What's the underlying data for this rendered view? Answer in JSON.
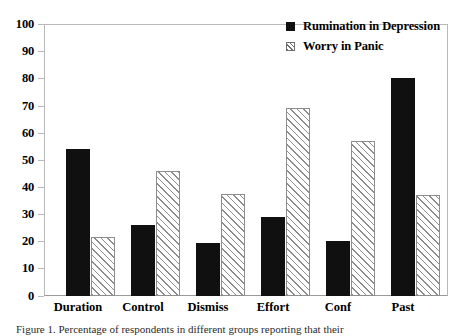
{
  "chart_data": {
    "type": "bar",
    "title": "",
    "xlabel": "",
    "ylabel": "",
    "ylim": [
      0,
      100
    ],
    "yticks": [
      0,
      10,
      20,
      30,
      40,
      50,
      60,
      70,
      80,
      90,
      100
    ],
    "grid": false,
    "legend_position": "top-right-inside",
    "categories": [
      "Duration",
      "Control",
      "Dismiss",
      "Effort",
      "Conf",
      "Past"
    ],
    "series": [
      {
        "name": "Rumination in Depression",
        "style": "solid-black",
        "values": [
          54,
          26,
          19.5,
          29,
          20,
          80
        ]
      },
      {
        "name": "Worry in Panic",
        "style": "diagonal-hatch",
        "values": [
          21.5,
          46,
          37.5,
          69,
          57,
          37
        ]
      }
    ]
  },
  "legend": {
    "items": [
      {
        "label": "Rumination in Depression",
        "swatch": "solid-square-icon"
      },
      {
        "label": "Worry in Panic",
        "swatch": "hatched-square-icon"
      }
    ]
  },
  "caption": {
    "text": "Figure 1. Percentage of respondents in different groups reporting that their"
  },
  "colors": {
    "series_solid": "#101010",
    "series_hatch_line": "#8d8d8d",
    "background": "#ffffff",
    "frame": "#b9b9b9",
    "text": "#000000"
  }
}
